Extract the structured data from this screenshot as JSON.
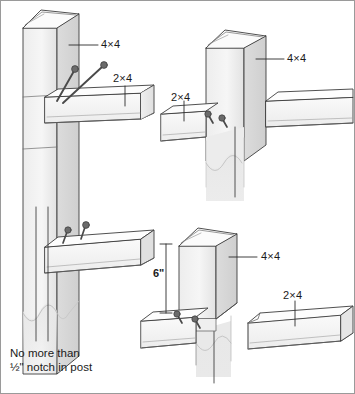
{
  "figure": {
    "background_color": "#ffffff",
    "line_color": "#3c3c3c",
    "wood_fill_light": "#f2f2f2",
    "wood_fill_mid": "#e3e3e3",
    "wood_fill_shadow": "#d4d4d4",
    "fastener_color": "#555555",
    "text_color": "#1a1a1a",
    "border_color": "#9a9a9a"
  },
  "details": [
    {
      "id": "detail-top-left",
      "name": "notched-post-toenail-detail",
      "post_label": "4×4",
      "rail_label": "2×4",
      "fastener_count": 2,
      "fastener_type": "nail"
    },
    {
      "id": "detail-top-right",
      "name": "through-rail-post-detail",
      "post_label": "4×4",
      "rail_label": "2×4",
      "fastener_count": 2,
      "fastener_type": "nail"
    },
    {
      "id": "detail-bottom-left",
      "name": "notch-depth-detail",
      "fastener_count": 2,
      "fastener_type": "nail"
    },
    {
      "id": "detail-bottom-right",
      "name": "post-top-rail-butt-detail",
      "post_label": "4×4",
      "rail_label": "2×4",
      "dimension_label": "6\"",
      "fastener_count": 2,
      "fastener_type": "nail"
    }
  ],
  "labels": {
    "post_top_left": "4×4",
    "rail_top_left": "2×4",
    "post_top_right": "4×4",
    "rail_top_right": "2×4",
    "post_bottom_right": "4×4",
    "rail_bottom_right": "2×4",
    "dimension_six_inch": "6\"",
    "note_line_1": "No more than",
    "note_line_2": "½\" notch in post"
  }
}
